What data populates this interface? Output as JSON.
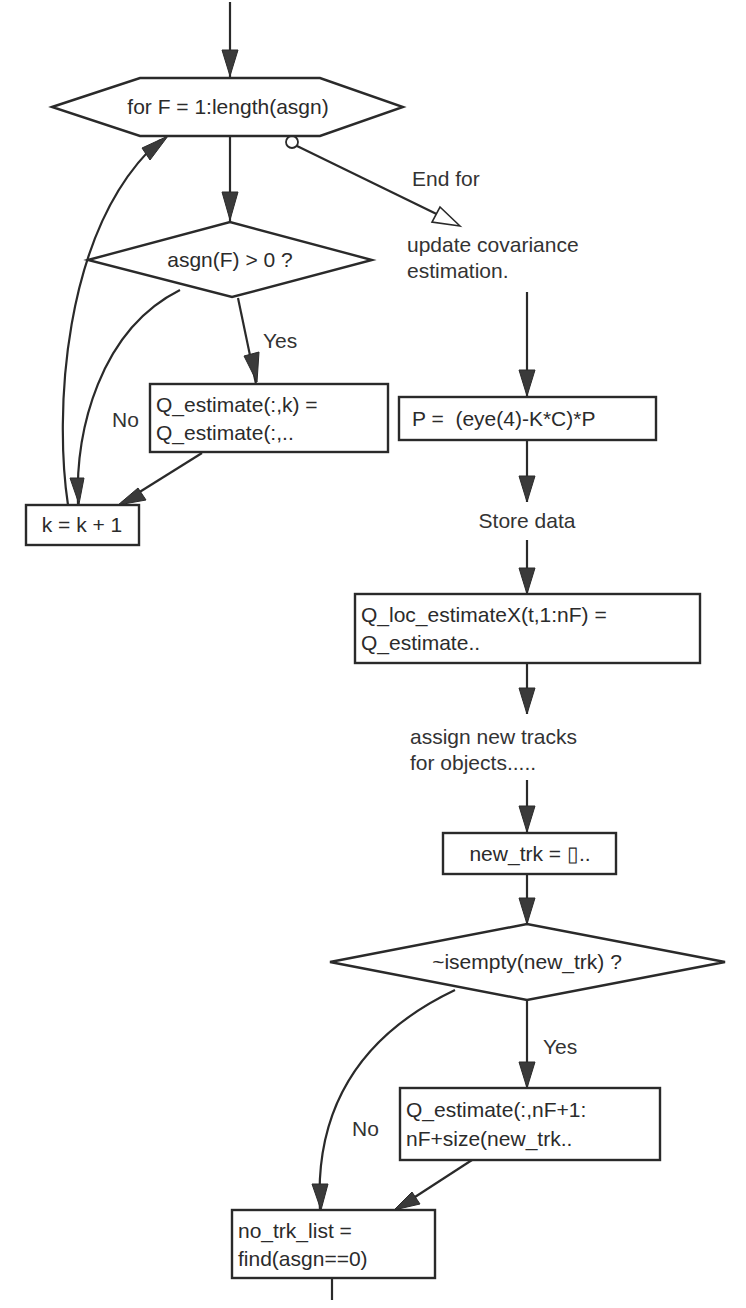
{
  "diagram": {
    "type": "flowchart",
    "colors": {
      "stroke": "#2a2a2a",
      "fill": "#ffffff",
      "text": "#2b2b2b",
      "background": "#ffffff"
    },
    "nodes": {
      "for_loop": {
        "shape": "hexagon",
        "text": "for F = 1:length(asgn)"
      },
      "cond_asgn": {
        "shape": "diamond",
        "text": "asgn(F) > 0 ?"
      },
      "q_estimate_k": {
        "shape": "rectangle",
        "line1": "Q_estimate(:,k) =",
        "line2": "Q_estimate(:,.."
      },
      "k_increment": {
        "shape": "rectangle",
        "text": "k = k + 1"
      },
      "update_cov": {
        "shape": "label",
        "line1": "update covariance",
        "line2": "estimation."
      },
      "p_update": {
        "shape": "rectangle",
        "text": "P =  (eye(4)-K*C)*P"
      },
      "store_data": {
        "shape": "label",
        "text": "Store data"
      },
      "q_loc": {
        "shape": "rectangle",
        "line1": "Q_loc_estimateX(t,1:nF) =",
        "line2": "Q_estimate.."
      },
      "assign_tracks": {
        "shape": "label",
        "line1": "assign new tracks",
        "line2": "for objects....."
      },
      "new_trk": {
        "shape": "rectangle",
        "text": "new_trk = []..",
        "display": "new_trk = ▯.."
      },
      "cond_empty": {
        "shape": "diamond",
        "text": "~isempty(new_trk) ?"
      },
      "q_estimate_nf": {
        "shape": "rectangle",
        "line1": "Q_estimate(:,nF+1:",
        "line2": "nF+size(new_trk.."
      },
      "no_trk_list": {
        "shape": "rectangle",
        "line1": "no_trk_list =",
        "line2": "find(asgn==0)"
      }
    },
    "edge_labels": {
      "end_for": "End for",
      "yes_1": "Yes",
      "no_1": "No",
      "yes_2": "Yes",
      "no_2": "No"
    },
    "edges": [
      {
        "from": "start",
        "to": "for_loop"
      },
      {
        "from": "for_loop",
        "to": "cond_asgn"
      },
      {
        "from": "for_loop",
        "to": "update_cov",
        "label": "End for",
        "style": "loop-exit"
      },
      {
        "from": "cond_asgn",
        "to": "q_estimate_k",
        "label": "Yes"
      },
      {
        "from": "cond_asgn",
        "to": "k_increment",
        "label": "No"
      },
      {
        "from": "q_estimate_k",
        "to": "k_increment"
      },
      {
        "from": "k_increment",
        "to": "for_loop",
        "style": "loop-back"
      },
      {
        "from": "update_cov",
        "to": "p_update"
      },
      {
        "from": "p_update",
        "to": "store_data"
      },
      {
        "from": "store_data",
        "to": "q_loc"
      },
      {
        "from": "q_loc",
        "to": "assign_tracks"
      },
      {
        "from": "assign_tracks",
        "to": "new_trk"
      },
      {
        "from": "new_trk",
        "to": "cond_empty"
      },
      {
        "from": "cond_empty",
        "to": "q_estimate_nf",
        "label": "Yes"
      },
      {
        "from": "cond_empty",
        "to": "no_trk_list",
        "label": "No"
      },
      {
        "from": "q_estimate_nf",
        "to": "no_trk_list"
      },
      {
        "from": "no_trk_list",
        "to": "continue"
      }
    ]
  }
}
